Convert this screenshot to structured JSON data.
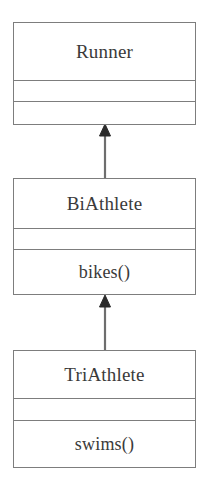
{
  "diagram": {
    "kind": "uml-class-diagram",
    "relationship_type": "generalization",
    "colors": {
      "border": "#7d7d7d",
      "text": "#3a3a3a",
      "background": "#ffffff",
      "connector": "#6e6e6e"
    },
    "classes": [
      {
        "id": "runner",
        "name": "Runner",
        "attributes": [],
        "operations": [],
        "attributes_text": "",
        "operations_text": ""
      },
      {
        "id": "biathlete",
        "name": "BiAthlete",
        "attributes": [],
        "operations": [
          "bikes()"
        ],
        "attributes_text": "",
        "operations_text": "bikes()"
      },
      {
        "id": "triathlete",
        "name": "TriAthlete",
        "attributes": [],
        "operations": [
          "swims()"
        ],
        "attributes_text": "",
        "operations_text": "swims()"
      }
    ],
    "connectors": [
      {
        "id": "biathlete-to-runner",
        "from": "biathlete",
        "to": "runner",
        "arrow": "hollow-triangle-filled"
      },
      {
        "id": "triathlete-to-biathlete",
        "from": "triathlete",
        "to": "biathlete",
        "arrow": "hollow-triangle-filled"
      }
    ]
  }
}
